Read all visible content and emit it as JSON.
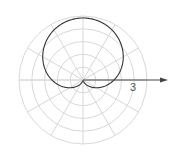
{
  "chart_data": {
    "type": "line",
    "coordinate_system": "polar",
    "title": "",
    "equation": "r = a(1 + sin θ)",
    "curve": {
      "name": "cardioid",
      "a": 1.5,
      "theta_range_deg": [
        0,
        360
      ],
      "max_r": 3,
      "color": "#333333"
    },
    "grid": {
      "on": true,
      "circles": 5,
      "radial_lines_every_deg": 30,
      "color": "#d8d8d8"
    },
    "polar_axis": {
      "direction_deg": 0,
      "arrow": true,
      "color": "#444444"
    },
    "annotations": [
      {
        "text": "3",
        "r": 3,
        "theta_deg": -10
      }
    ]
  },
  "labels": {
    "axis_label": "3"
  }
}
